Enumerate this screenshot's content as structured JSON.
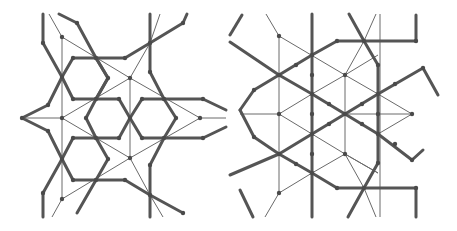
{
  "figure": {
    "panels": [
      {
        "name": "left-panel",
        "thick_paths": [
          "43,14 43,43 62,77",
          "59,14 77,23 96,58",
          "62,77 73,58 96,58 108,78 96,99 73,99 62,77",
          "96,99 119,99 130,118 119,138 96,138 86,118 96,99",
          "130,118 142,99 164,99 176,118 164,138 142,138 130,118",
          "62,159 73,138 96,138 108,159 96,180 73,180 62,159",
          "96,58 125,58 150,43 183,23 187,14",
          "150,14 150,72 164,99",
          "164,99 203,99 226,110",
          "164,138 203,138 226,127",
          "62,77 48,105 22,118 48,131 62,159",
          "62,159 43,193 43,217",
          "96,180 125,180 150,195 183,213",
          "164,138 150,165 150,217",
          "96,180 77,213",
          "96,58 108,78",
          "108,78 96,99"
        ],
        "thin_paths": [
          "49,14 62,37 62,199 52,217",
          "62,37 130,78 200,118 226,118",
          "62,118 130,78",
          "130,78 150,43 160,14",
          "130,78 130,158",
          "62,118 130,158 200,118",
          "22,118 62,118",
          "62,199 130,158",
          "130,158 150,195 163,217"
        ],
        "nodes": [
          [
            43,
            43
          ],
          [
            62,
            77
          ],
          [
            77,
            23
          ],
          [
            73,
            58
          ],
          [
            96,
            58
          ],
          [
            108,
            78
          ],
          [
            96,
            99
          ],
          [
            73,
            99
          ],
          [
            119,
            99
          ],
          [
            130,
            118
          ],
          [
            119,
            138
          ],
          [
            96,
            138
          ],
          [
            86,
            118
          ],
          [
            142,
            99
          ],
          [
            164,
            99
          ],
          [
            176,
            118
          ],
          [
            164,
            138
          ],
          [
            142,
            138
          ],
          [
            73,
            138
          ],
          [
            108,
            159
          ],
          [
            96,
            180
          ],
          [
            73,
            180
          ],
          [
            62,
            159
          ],
          [
            125,
            58
          ],
          [
            150,
            43
          ],
          [
            183,
            23
          ],
          [
            150,
            72
          ],
          [
            203,
            99
          ],
          [
            203,
            138
          ],
          [
            48,
            105
          ],
          [
            22,
            118
          ],
          [
            48,
            131
          ],
          [
            43,
            193
          ],
          [
            125,
            180
          ],
          [
            150,
            195
          ],
          [
            183,
            213
          ],
          [
            150,
            165
          ],
          [
            62,
            118
          ],
          [
            130,
            78
          ],
          [
            130,
            158
          ],
          [
            62,
            199
          ],
          [
            200,
            118
          ],
          [
            62,
            37
          ]
        ]
      },
      {
        "name": "right-panel",
        "thick_paths": [
          "312,14 312,217",
          "337,41 364,41 416,41 416,15",
          "349,14 364,41 378,65 378,163 364,188 348,217",
          "337,188 364,188 416,188 416,217",
          "230,42 279,75 312,94 345,114 378,134 412,160 423,150",
          "279,75 312,55 337,41",
          "240,110 254,90 279,75",
          "240,110 254,137 279,154",
          "230,175 279,154 312,134 345,114 378,94 423,68 438,95",
          "279,154 312,173 337,188",
          "240,190 253,217",
          "242,15 230,35"
        ],
        "thin_paths": [
          "266,14 279,36 279,193 265,217",
          "279,36 345,75 378,94",
          "279,114 312,94 345,75 378,55",
          "279,114 312,134 345,154 378,173",
          "345,75 345,154",
          "345,154 312,173 279,193",
          "345,114 412,114",
          "378,94 412,114 378,134",
          "240,114 279,114",
          "380,14 380,217",
          "345,154 364,188 376,217",
          "345,75 364,41 376,14",
          "378,173 345,154"
        ],
        "nodes": [
          [
            279,
            36
          ],
          [
            312,
            55
          ],
          [
            345,
            75
          ],
          [
            279,
            75
          ],
          [
            312,
            94
          ],
          [
            378,
            94
          ],
          [
            279,
            114
          ],
          [
            345,
            114
          ],
          [
            412,
            114
          ],
          [
            312,
            134
          ],
          [
            378,
            134
          ],
          [
            279,
            154
          ],
          [
            345,
            154
          ],
          [
            312,
            173
          ],
          [
            279,
            193
          ],
          [
            337,
            41
          ],
          [
            364,
            41
          ],
          [
            416,
            41
          ],
          [
            378,
            65
          ],
          [
            378,
            163
          ],
          [
            364,
            188
          ],
          [
            337,
            188
          ],
          [
            416,
            188
          ],
          [
            254,
            90
          ],
          [
            254,
            137
          ],
          [
            423,
            68
          ],
          [
            412,
            160
          ],
          [
            296,
            65
          ],
          [
            296,
            164
          ],
          [
            312,
            75
          ],
          [
            312,
            114
          ],
          [
            312,
            154
          ],
          [
            329,
            104
          ],
          [
            329,
            124
          ],
          [
            362,
            104
          ],
          [
            362,
            124
          ],
          [
            395,
            84
          ],
          [
            395,
            144
          ],
          [
            378,
            114
          ]
        ]
      }
    ]
  }
}
